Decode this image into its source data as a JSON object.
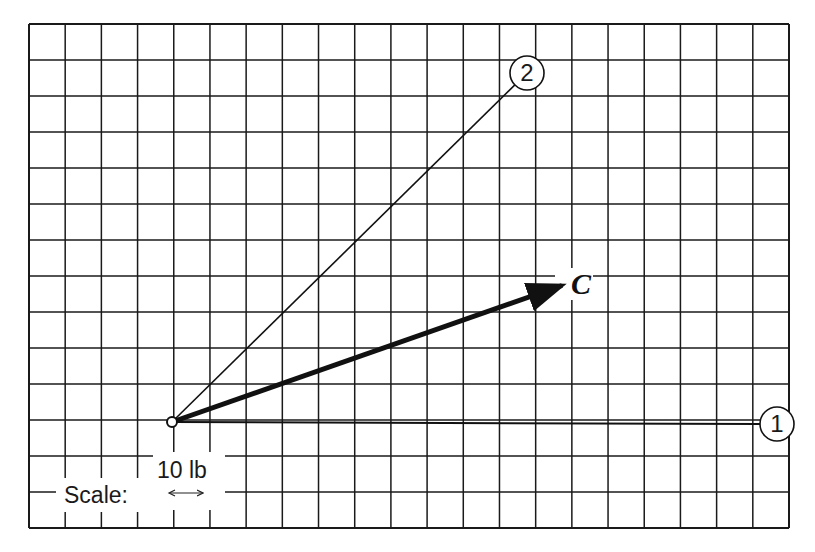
{
  "figure": {
    "type": "vector-graph-paper-diagram",
    "grid": {
      "left": 29,
      "top": 24,
      "right": 789,
      "bottom": 528,
      "columns": 21,
      "rows": 14,
      "line_color": "#1a1a1a"
    },
    "origin": {
      "x": 172,
      "y": 422
    },
    "vectors": [
      {
        "id": "1",
        "label": "1",
        "kind": "reference-line",
        "end": {
          "x": 777,
          "y": 424
        },
        "circled_label": true
      },
      {
        "id": "2",
        "label": "2",
        "kind": "reference-line",
        "end": {
          "x": 527,
          "y": 73
        },
        "circled_label": true
      },
      {
        "id": "C",
        "label": "C",
        "kind": "resultant-arrow",
        "end": {
          "x": 566,
          "y": 284
        },
        "bold": true
      }
    ],
    "scale": {
      "label": "Scale:",
      "value_label": "10 lb",
      "arrow_symbol": "↔"
    }
  }
}
